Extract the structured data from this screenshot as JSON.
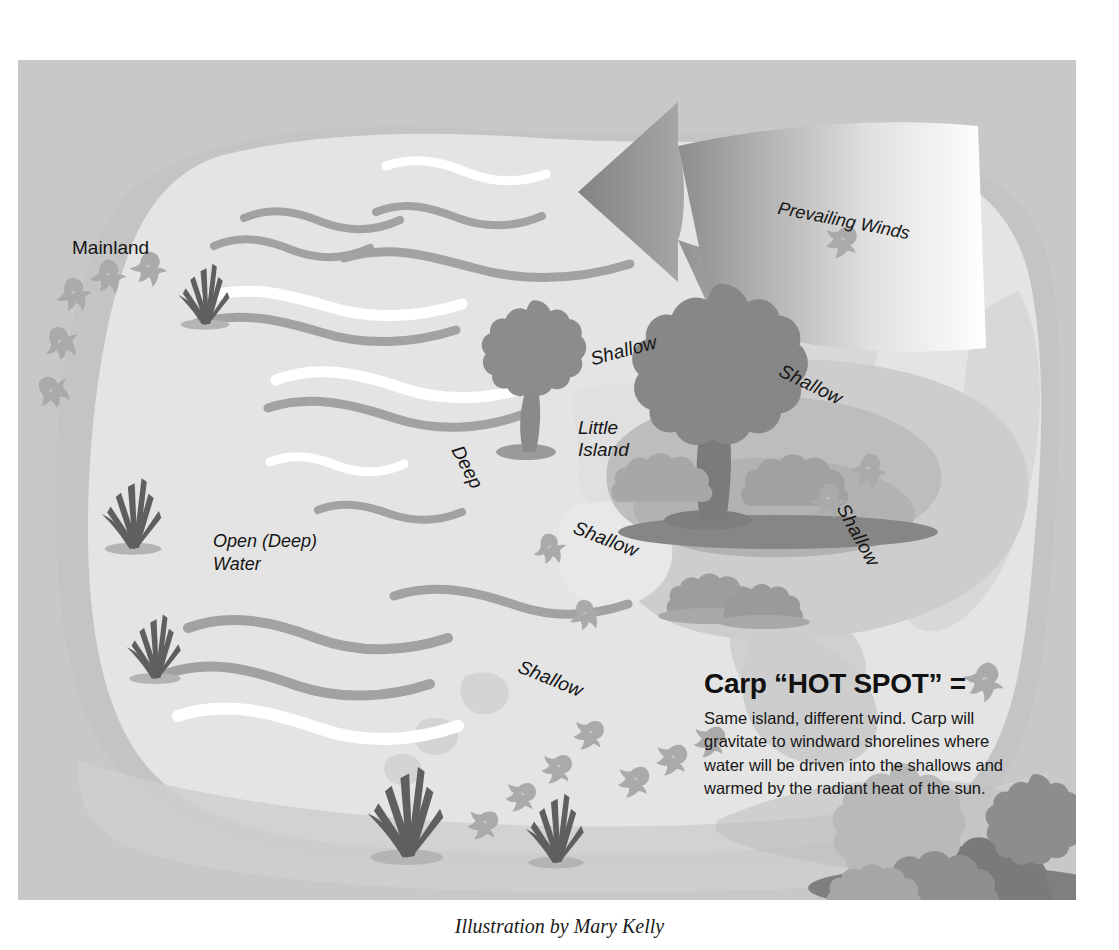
{
  "illustration": {
    "title_labels": {
      "mainland": "Mainland",
      "open_water": "Open (Deep)\nWater",
      "deep": "Deep",
      "little_island": "Little\nIsland",
      "prevailing_winds": "Prevailing Winds"
    },
    "shallow_labels": [
      {
        "id": "shallow-north",
        "text": "Shallow"
      },
      {
        "id": "shallow-northeast",
        "text": "Shallow"
      },
      {
        "id": "shallow-southwest",
        "text": "Shallow"
      },
      {
        "id": "shallow-east",
        "text": "Shallow"
      },
      {
        "id": "shallow-south",
        "text": "Shallow"
      }
    ],
    "callout": {
      "title": "Carp “HOT SPOT” =",
      "body": "Same island, different wind. Carp will gravitate to windward shorelines where water will be driven into the shallows and warmed by the radiant heat of the sun."
    },
    "credit": "Illustration by Mary Kelly",
    "colors": {
      "frame_background": "#c8c8c8",
      "mainland": "#c6c6c6",
      "open_water": "#e3e3e3",
      "shallow_water": "#d2d2d2",
      "island_land": "#b6b6b6",
      "tree_canopy": "#8c8c8c",
      "tree_canopy_dark": "#7b7b7b",
      "reed_dark": "#5f5f5f",
      "fish": "#a9a9a9",
      "wave_light": "#ffffff",
      "wave_dark": "#a3a3a3",
      "arrow_head": "#8f8f8f",
      "text": "#151515"
    }
  }
}
